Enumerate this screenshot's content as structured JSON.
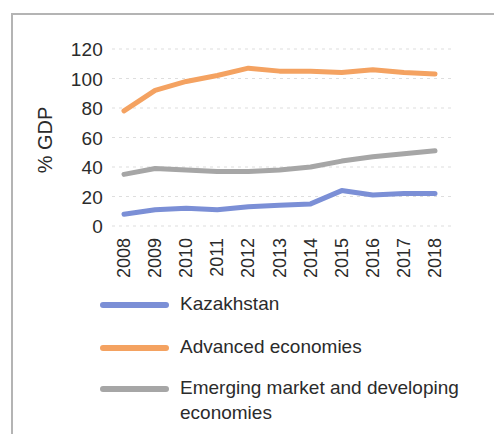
{
  "chart_data": {
    "type": "line",
    "title": "",
    "xlabel": "",
    "ylabel": "% GDP",
    "ylim": [
      0,
      120
    ],
    "yticks": [
      0,
      20,
      40,
      60,
      80,
      100,
      120
    ],
    "grid": true,
    "legend_position": "bottom-left",
    "categories": [
      "2008",
      "2009",
      "2010",
      "2011",
      "2012",
      "2013",
      "2014",
      "2015",
      "2016",
      "2017",
      "2018"
    ],
    "series": [
      {
        "name": "Kazakhstan",
        "color": "#7b8fd6",
        "values": [
          8,
          11,
          12,
          11,
          13,
          14,
          15,
          24,
          21,
          22,
          22
        ]
      },
      {
        "name": "Advanced economies",
        "color": "#f4a261",
        "values": [
          78,
          92,
          98,
          102,
          107,
          105,
          105,
          104,
          106,
          104,
          103
        ]
      },
      {
        "name": "Emerging market and developing economies",
        "color": "#a6a6a6",
        "values": [
          35,
          39,
          38,
          37,
          37,
          38,
          40,
          44,
          47,
          49,
          51
        ]
      }
    ]
  },
  "axes": {
    "ylabel_text": "% GDP"
  },
  "legend": {
    "items": [
      {
        "label": "Kazakhstan",
        "color": "#7b8fd6"
      },
      {
        "label": "Advanced economies",
        "color": "#f4a261"
      },
      {
        "label": "Emerging market and developing",
        "label2": "economies",
        "color": "#a6a6a6"
      }
    ]
  }
}
